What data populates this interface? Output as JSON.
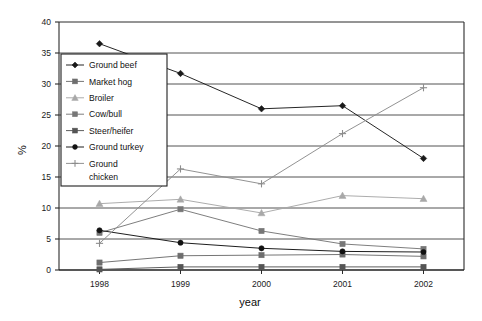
{
  "chart_data": {
    "type": "line",
    "title": "",
    "xlabel": "year",
    "ylabel": "%",
    "categories": [
      "1998",
      "1999",
      "2000",
      "2001",
      "2002"
    ],
    "x": [
      1998,
      1999,
      2000,
      2001,
      2002
    ],
    "ylim": [
      0,
      40
    ],
    "ytick_step": 5,
    "yticks": [
      "0",
      "5",
      "10",
      "15",
      "20",
      "25",
      "30",
      "35",
      "40"
    ],
    "grid": "horizontal",
    "legend_position": "upper-left-inside",
    "series": [
      {
        "name": "Ground beef",
        "marker": "diamond",
        "color": "#1a1a1a",
        "values": [
          36.5,
          31.7,
          26.0,
          26.5,
          18.0
        ]
      },
      {
        "name": "Market hog",
        "marker": "square",
        "color": "#6e6e6e",
        "values": [
          1.2,
          2.3,
          2.4,
          2.5,
          2.2
        ]
      },
      {
        "name": "Broiler",
        "marker": "triangle",
        "color": "#a8a8a8",
        "values": [
          10.7,
          11.4,
          9.2,
          12.0,
          11.5
        ]
      },
      {
        "name": "Cow/bull",
        "marker": "square",
        "color": "#777777",
        "values": [
          6.0,
          9.8,
          6.3,
          4.2,
          3.4
        ]
      },
      {
        "name": "Steer/heifer",
        "marker": "square",
        "color": "#555555",
        "values": [
          0.1,
          0.5,
          0.5,
          0.5,
          0.5
        ]
      },
      {
        "name": "Ground turkey",
        "marker": "circle",
        "color": "#121212",
        "values": [
          6.4,
          4.4,
          3.5,
          3.0,
          2.9
        ]
      },
      {
        "name": "Ground chicken",
        "marker": "plus",
        "color": "#8c8c8c",
        "values": [
          4.3,
          16.3,
          13.9,
          22.0,
          29.4
        ]
      }
    ]
  },
  "legend": {
    "entries": [
      {
        "label": "Ground beef"
      },
      {
        "label": "Market hog"
      },
      {
        "label": "Broiler"
      },
      {
        "label": "Cow/bull"
      },
      {
        "label": "Steer/heifer"
      },
      {
        "label": "Ground turkey"
      },
      {
        "label": "Ground"
      },
      {
        "label": "chicken"
      }
    ]
  }
}
